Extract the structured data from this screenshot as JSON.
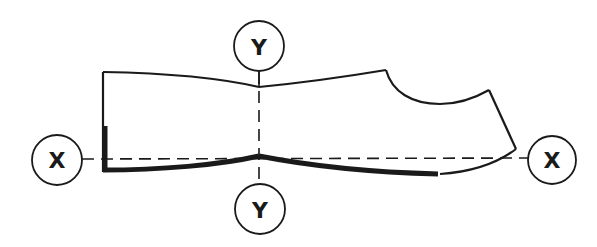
{
  "diagram": {
    "type": "shoe-last-axes",
    "colors": {
      "line": "#1a1a1a",
      "background": "#ffffff"
    },
    "axis_labels": {
      "x_left": "X",
      "x_right": "X",
      "y_top": "Y",
      "y_bottom": "Y"
    }
  }
}
